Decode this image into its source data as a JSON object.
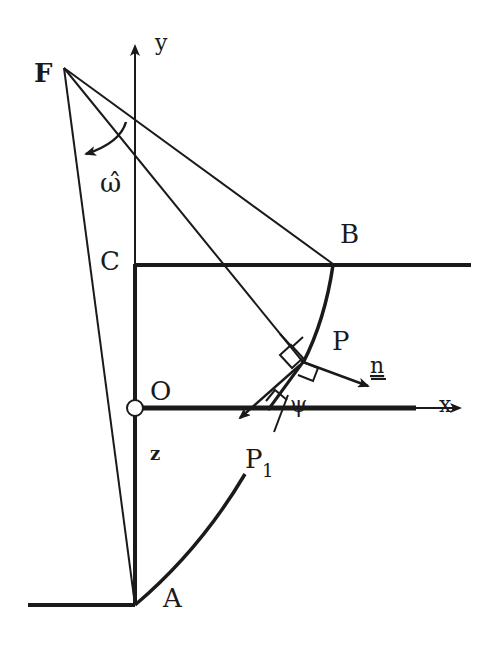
{
  "figure": {
    "labels": {
      "F": "F",
      "y_axis": "y",
      "x_axis": "x",
      "omega": "ω̂",
      "B": "B",
      "C": "C",
      "P": "P",
      "n": "n",
      "O": "O",
      "z": "z",
      "psi": "ψ",
      "P1": "P",
      "P1_sub": "1",
      "A": "A"
    }
  }
}
